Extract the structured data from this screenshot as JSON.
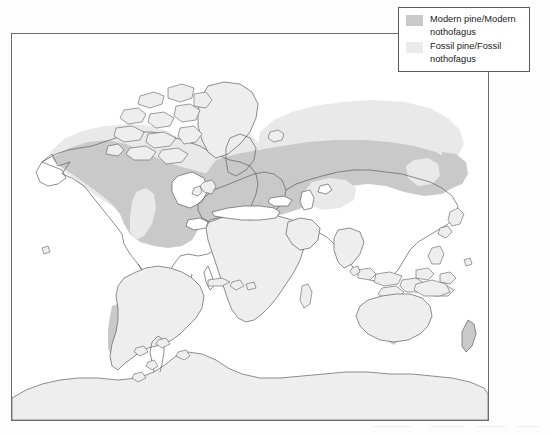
{
  "figure": {
    "type": "map",
    "title": "",
    "projection": "world-equirectangular",
    "frame": {
      "border_color": "#6b6b6b",
      "background": "#ffffff"
    },
    "land_fill": "#eeeeee",
    "land_outline": "#5f5f5f"
  },
  "legend": {
    "position": "top-right",
    "border_color": "#5a5a5a",
    "background": "#ffffff",
    "items": [
      {
        "label": "Modern pine/Modern\nnothofagus",
        "swatch_color": "#c9c9c9",
        "swatch_name": "modern-range-swatch"
      },
      {
        "label": "Fossil pine/Fossil\nnothofagus",
        "swatch_color": "#ebebeb",
        "swatch_name": "fossil-range-swatch"
      }
    ]
  },
  "map_data": {
    "regions": [
      {
        "name": "north-america-modern-range",
        "category": "Modern pine/Modern nothofagus"
      },
      {
        "name": "north-america-fossil-range",
        "category": "Fossil pine/Fossil nothofagus"
      },
      {
        "name": "eurasia-modern-range",
        "category": "Modern pine/Modern nothofagus"
      },
      {
        "name": "eurasia-fossil-range",
        "category": "Fossil pine/Fossil nothofagus"
      },
      {
        "name": "iberia-mediterranean-modern-range",
        "category": "Modern pine/Modern nothofagus"
      },
      {
        "name": "southern-south-america-modern-range",
        "category": "Modern pine/Modern nothofagus"
      },
      {
        "name": "tasmania-modern-range",
        "category": "Modern pine/Modern nothofagus"
      },
      {
        "name": "new-zealand-modern-range",
        "category": "Modern pine/Modern nothofagus"
      }
    ],
    "continents_plain": [
      "greenland",
      "africa",
      "arabia",
      "india",
      "south-america-north",
      "australia",
      "antarctica",
      "southeast-asia-islands"
    ]
  }
}
